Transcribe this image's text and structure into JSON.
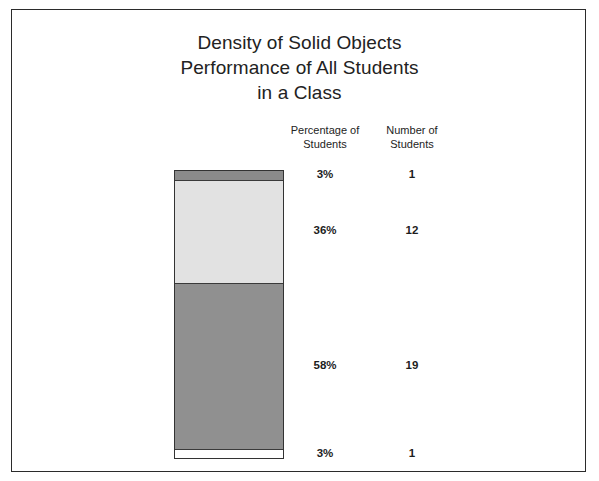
{
  "title": {
    "line1": "Density of Solid Objects",
    "line2": "Performance of All Students",
    "line3": "in a Class"
  },
  "columns": {
    "percentage": {
      "line1": "Percentage of",
      "line2": "Students"
    },
    "number": {
      "line1": "Number of",
      "line2": "Students"
    }
  },
  "rows": [
    {
      "percent": "3%",
      "count": "1"
    },
    {
      "percent": "36%",
      "count": "12"
    },
    {
      "percent": "58%",
      "count": "19"
    },
    {
      "percent": "3%",
      "count": "1"
    }
  ],
  "chart_data": {
    "type": "bar",
    "subtype": "stacked-single-bar",
    "title": "Density of Solid Objects Performance of All Students in a Class",
    "xlabel": "",
    "ylabel": "",
    "orientation": "vertical",
    "total_students": 33,
    "categories": [
      "3%",
      "36%",
      "58%",
      "3%"
    ],
    "values": [
      3,
      36,
      58,
      3
    ],
    "counts": [
      1,
      12,
      19,
      1
    ],
    "segment_colors": [
      "#8b8b8b",
      "#e2e2e2",
      "#909090",
      "#ffffff"
    ],
    "segment_order_top_to_bottom": true,
    "annotation_columns": [
      "Percentage of Students",
      "Number of Students"
    ],
    "grid": false,
    "legend": "none",
    "ylim": [
      0,
      100
    ]
  }
}
